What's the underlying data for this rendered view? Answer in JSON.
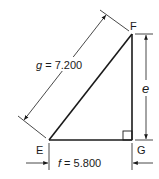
{
  "diagram": {
    "type": "right-triangle-dimensioned",
    "vertices": {
      "E": {
        "label": "E",
        "x": 49,
        "y": 140
      },
      "F": {
        "label": "F",
        "x": 132,
        "y": 34
      },
      "G": {
        "label": "G",
        "x": 132,
        "y": 140
      }
    },
    "right_angle_at": "G",
    "sides": {
      "g": {
        "label": "g = 7.200",
        "var": "g",
        "value": "7.200",
        "between": [
          "E",
          "F"
        ]
      },
      "f": {
        "label": "f = 5.800",
        "var": "f",
        "value": "5.800",
        "between": [
          "E",
          "G"
        ]
      },
      "e": {
        "label": "e",
        "var": "e",
        "between": [
          "G",
          "F"
        ]
      }
    },
    "colors": {
      "stroke": "#1a1a1a",
      "background": "#ffffff"
    }
  }
}
